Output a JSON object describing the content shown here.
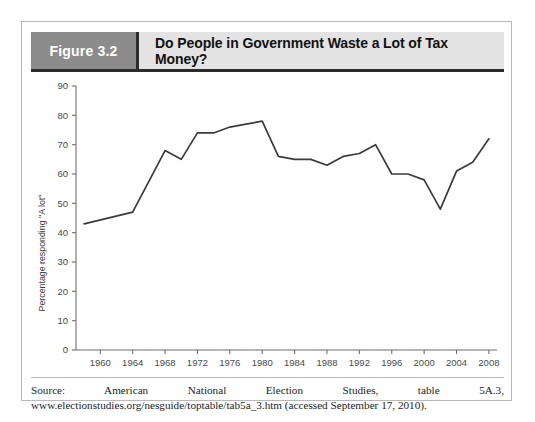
{
  "figure": {
    "number_label": "Figure 3.2",
    "title": "Do People in Government Waste a Lot of Tax Money?",
    "source_note": "Source: American National Election Studies, table 5A.3, www.electionstudies.org/nesguide/toptable/tab5a_3.htm (accessed September 17, 2010).",
    "header_block_color": "#8c8c8c",
    "header_title_color": "#e3e3e3",
    "line_color": "#3b3b3b"
  },
  "chart_data": {
    "type": "line",
    "title": "Do People in Government Waste a Lot of Tax Money?",
    "xlabel": "",
    "ylabel": "Percentage responding \"A lot\"",
    "xlim": [
      1957,
      2009
    ],
    "ylim": [
      0,
      90
    ],
    "grid": false,
    "legend": "none",
    "ytick_labels": [
      "0",
      "10",
      "20",
      "30",
      "40",
      "50",
      "60",
      "70",
      "80",
      "90"
    ],
    "yticks": [
      0,
      10,
      20,
      30,
      40,
      50,
      60,
      70,
      80,
      90
    ],
    "xtick_labels": [
      "1960",
      "1964",
      "1968",
      "1972",
      "1976",
      "1980",
      "1984",
      "1988",
      "1992",
      "1996",
      "2000",
      "2004",
      "2008"
    ],
    "xticks": [
      1960,
      1964,
      1968,
      1972,
      1976,
      1980,
      1984,
      1988,
      1992,
      1996,
      2000,
      2004,
      2008
    ],
    "series": [
      {
        "name": "Percentage responding \"A lot\"",
        "x": [
          1958,
          1964,
          1968,
          1970,
          1972,
          1974,
          1976,
          1978,
          1980,
          1982,
          1984,
          1986,
          1988,
          1990,
          1992,
          1994,
          1996,
          1998,
          2000,
          2002,
          2004,
          2006,
          2008
        ],
        "values": [
          43,
          47,
          68,
          65,
          74,
          74,
          76,
          77,
          78,
          66,
          65,
          65,
          63,
          66,
          67,
          70,
          60,
          60,
          58,
          48,
          61,
          64,
          72
        ]
      }
    ]
  }
}
